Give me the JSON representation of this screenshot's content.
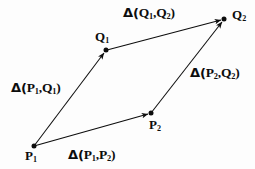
{
  "figure": {
    "background_color": "#fdfdfd",
    "ink_color": "#0d0d0d",
    "vertices": [
      {
        "id": "P1",
        "base": "P",
        "sub": "1",
        "x": 34,
        "y": 146
      },
      {
        "id": "P2",
        "base": "P",
        "sub": "2",
        "x": 151,
        "y": 113
      },
      {
        "id": "Q1",
        "base": "Q",
        "sub": "1",
        "x": 106,
        "y": 50
      },
      {
        "id": "Q2",
        "base": "Q",
        "sub": "2",
        "x": 224,
        "y": 19
      }
    ],
    "edges": [
      {
        "id": "P1-P2",
        "from": "P1",
        "to": "P2",
        "x1": 34,
        "y1": 146,
        "x2": 151,
        "y2": 113,
        "arrowhead": "to",
        "label_prefix": "Δ(",
        "label_first_base": "P",
        "label_first_sub": "1",
        "label_sep": ",",
        "label_second_base": "P",
        "label_second_sub": "2",
        "label_suffix": ")"
      },
      {
        "id": "P1-Q1",
        "from": "P1",
        "to": "Q1",
        "x1": 34,
        "y1": 146,
        "x2": 106,
        "y2": 50,
        "arrowhead": "to",
        "label_prefix": "Δ(",
        "label_first_base": "P",
        "label_first_sub": "1",
        "label_sep": ",",
        "label_second_base": "Q",
        "label_second_sub": "1",
        "label_suffix": ")"
      },
      {
        "id": "Q1-Q2",
        "from": "Q1",
        "to": "Q2",
        "x1": 107,
        "y1": 50,
        "x2": 224,
        "y2": 19,
        "arrowhead": "to",
        "label_prefix": "Δ(",
        "label_first_base": "Q",
        "label_first_sub": "1",
        "label_sep": ",",
        "label_second_base": "Q",
        "label_second_sub": "2",
        "label_suffix": ")"
      },
      {
        "id": "P2-Q2",
        "from": "P2",
        "to": "Q2",
        "x1": 151,
        "y1": 113,
        "x2": 224,
        "y2": 19,
        "arrowhead": "to",
        "label_prefix": "Δ(",
        "label_first_base": "P",
        "label_first_sub": "2",
        "label_sep": ",",
        "label_second_base": "Q",
        "label_second_sub": "2",
        "label_suffix": ")"
      }
    ]
  }
}
